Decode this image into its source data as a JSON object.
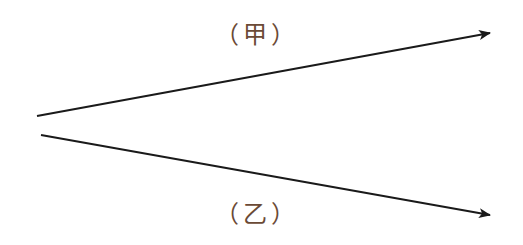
{
  "diagram": {
    "type": "two rays from a common origin region",
    "colors": {
      "line": "#1a1a1a",
      "label": "#6b4a36",
      "background": "#ffffff"
    },
    "rays": [
      {
        "id": "jia",
        "label": "（甲）",
        "start": [
          37,
          116
        ],
        "end": [
          490,
          33
        ]
      },
      {
        "id": "yi",
        "label": "（乙）",
        "start": [
          41,
          135
        ],
        "end": [
          490,
          215
        ]
      }
    ]
  }
}
